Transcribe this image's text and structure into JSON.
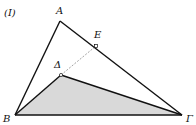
{
  "figure": {
    "label": "(I)",
    "fill_color": "#d9d9d9",
    "line_color": "#111111",
    "dashed_color": "#999999"
  },
  "points": {
    "A": {
      "name": "A",
      "x": 60,
      "y": 21
    },
    "B": {
      "name": "B",
      "x": 15,
      "y": 115
    },
    "G": {
      "name": "Γ",
      "x": 182,
      "y": 115
    },
    "E": {
      "name": "E",
      "x": 96,
      "y": 46
    },
    "D": {
      "name": "Δ",
      "x": 61,
      "y": 75
    }
  },
  "segments": [
    {
      "from": "A",
      "to": "B",
      "style": "solid"
    },
    {
      "from": "A",
      "to": "Γ",
      "style": "solid"
    },
    {
      "from": "B",
      "to": "Γ",
      "style": "solid"
    },
    {
      "from": "B",
      "to": "Δ",
      "style": "solid"
    },
    {
      "from": "Δ",
      "to": "Γ",
      "style": "solid"
    },
    {
      "from": "Δ",
      "to": "E",
      "style": "dashed"
    }
  ],
  "shaded_region": [
    "B",
    "Δ",
    "Γ"
  ]
}
